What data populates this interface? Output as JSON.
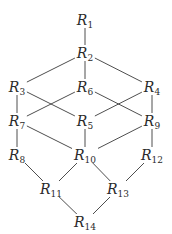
{
  "diagram": {
    "type": "lattice",
    "nodes": [
      {
        "id": "R1",
        "base": "R",
        "sub": "1",
        "x": 85,
        "y": 20
      },
      {
        "id": "R2",
        "base": "R",
        "sub": "2",
        "x": 85,
        "y": 53
      },
      {
        "id": "R3",
        "base": "R",
        "sub": "3",
        "x": 17,
        "y": 87
      },
      {
        "id": "R6",
        "base": "R",
        "sub": "6",
        "x": 85,
        "y": 87
      },
      {
        "id": "R4",
        "base": "R",
        "sub": "4",
        "x": 152,
        "y": 87
      },
      {
        "id": "R7",
        "base": "R",
        "sub": "7",
        "x": 17,
        "y": 121
      },
      {
        "id": "R5",
        "base": "R",
        "sub": "5",
        "x": 85,
        "y": 121
      },
      {
        "id": "R9",
        "base": "R",
        "sub": "9",
        "x": 152,
        "y": 121
      },
      {
        "id": "R8",
        "base": "R",
        "sub": "8",
        "x": 17,
        "y": 155
      },
      {
        "id": "R10",
        "base": "R",
        "sub": "10",
        "x": 85,
        "y": 155
      },
      {
        "id": "R12",
        "base": "R",
        "sub": "12",
        "x": 152,
        "y": 155
      },
      {
        "id": "R11",
        "base": "R",
        "sub": "11",
        "x": 51,
        "y": 189
      },
      {
        "id": "R13",
        "base": "R",
        "sub": "13",
        "x": 118,
        "y": 189
      },
      {
        "id": "R14",
        "base": "R",
        "sub": "14",
        "x": 85,
        "y": 222
      }
    ],
    "edges": [
      [
        "R1",
        "R2"
      ],
      [
        "R2",
        "R3"
      ],
      [
        "R2",
        "R6"
      ],
      [
        "R2",
        "R4"
      ],
      [
        "R3",
        "R7"
      ],
      [
        "R3",
        "R5"
      ],
      [
        "R6",
        "R7"
      ],
      [
        "R6",
        "R9"
      ],
      [
        "R4",
        "R5"
      ],
      [
        "R4",
        "R9"
      ],
      [
        "R7",
        "R8"
      ],
      [
        "R7",
        "R10"
      ],
      [
        "R5",
        "R10"
      ],
      [
        "R9",
        "R10"
      ],
      [
        "R9",
        "R12"
      ],
      [
        "R8",
        "R11"
      ],
      [
        "R10",
        "R11"
      ],
      [
        "R10",
        "R13"
      ],
      [
        "R12",
        "R13"
      ],
      [
        "R11",
        "R14"
      ],
      [
        "R13",
        "R14"
      ]
    ],
    "colors": {
      "edge": "#3a3a3a",
      "text": "#2a2a2a",
      "background": "#ffffff"
    }
  }
}
